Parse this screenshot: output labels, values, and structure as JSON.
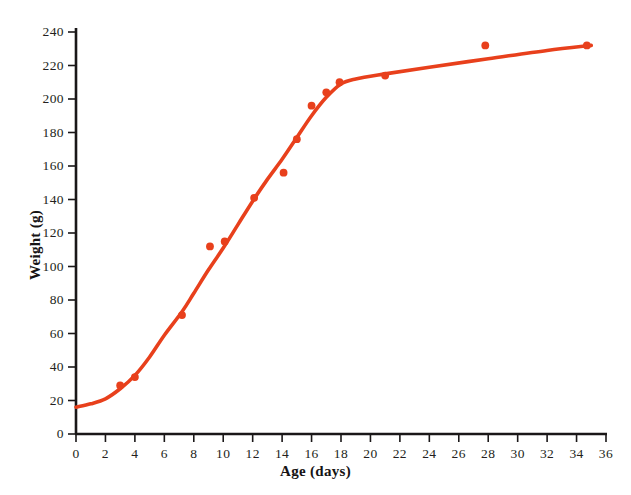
{
  "chart_data": {
    "type": "scatter",
    "title": "",
    "xlabel": "Age (days)",
    "ylabel": "Weight (g)",
    "xlim": [
      0,
      36
    ],
    "ylim": [
      0,
      240
    ],
    "xticks": [
      0,
      2,
      4,
      6,
      8,
      10,
      12,
      14,
      16,
      18,
      20,
      22,
      24,
      26,
      28,
      30,
      32,
      34,
      36
    ],
    "yticks": [
      0,
      20,
      40,
      60,
      80,
      100,
      120,
      140,
      160,
      180,
      200,
      220,
      240
    ],
    "xtick_labels": [
      "0",
      "2",
      "4",
      "6",
      "8",
      "10",
      "12",
      "14",
      "16",
      "18",
      "20",
      "22",
      "24",
      "26",
      "28",
      "30",
      "32",
      "34",
      "36"
    ],
    "ytick_labels": [
      "0",
      "20",
      "40",
      "60",
      "80",
      "100",
      "120",
      "140",
      "160",
      "180",
      "200",
      "220",
      "240"
    ],
    "grid": false,
    "legend": null,
    "series": [
      {
        "name": "observed-weights",
        "type": "scatter",
        "color": "#e8401c",
        "marker": "circle",
        "points": [
          {
            "x": 3.0,
            "y": 29
          },
          {
            "x": 4.0,
            "y": 34
          },
          {
            "x": 7.2,
            "y": 71
          },
          {
            "x": 9.1,
            "y": 112
          },
          {
            "x": 10.1,
            "y": 115
          },
          {
            "x": 12.1,
            "y": 141
          },
          {
            "x": 14.1,
            "y": 156
          },
          {
            "x": 15.0,
            "y": 176
          },
          {
            "x": 16.0,
            "y": 196
          },
          {
            "x": 17.0,
            "y": 204
          },
          {
            "x": 17.9,
            "y": 210
          },
          {
            "x": 21.0,
            "y": 214
          },
          {
            "x": 27.8,
            "y": 232
          },
          {
            "x": 34.7,
            "y": 232
          }
        ]
      },
      {
        "name": "fitted-growth-curve",
        "type": "line",
        "color": "#e8401c",
        "points": [
          {
            "x": 0.0,
            "y": 16
          },
          {
            "x": 1.0,
            "y": 18
          },
          {
            "x": 2.0,
            "y": 21
          },
          {
            "x": 3.0,
            "y": 27
          },
          {
            "x": 4.0,
            "y": 35
          },
          {
            "x": 5.0,
            "y": 46
          },
          {
            "x": 6.0,
            "y": 59
          },
          {
            "x": 7.2,
            "y": 73
          },
          {
            "x": 8.0,
            "y": 84
          },
          {
            "x": 9.0,
            "y": 98
          },
          {
            "x": 10.0,
            "y": 111
          },
          {
            "x": 11.0,
            "y": 125
          },
          {
            "x": 12.0,
            "y": 139
          },
          {
            "x": 13.0,
            "y": 152
          },
          {
            "x": 14.0,
            "y": 164
          },
          {
            "x": 15.0,
            "y": 177
          },
          {
            "x": 16.0,
            "y": 190
          },
          {
            "x": 17.0,
            "y": 201
          },
          {
            "x": 18.0,
            "y": 209
          },
          {
            "x": 19.0,
            "y": 212
          },
          {
            "x": 21.0,
            "y": 215
          },
          {
            "x": 24.0,
            "y": 219
          },
          {
            "x": 28.0,
            "y": 224
          },
          {
            "x": 32.0,
            "y": 229
          },
          {
            "x": 35.0,
            "y": 232
          }
        ]
      }
    ]
  },
  "axes": {
    "x_title": "Age (days)",
    "y_title": "Weight (g)",
    "axis_color": "#1a1718",
    "tick_color": "#1a1718"
  }
}
